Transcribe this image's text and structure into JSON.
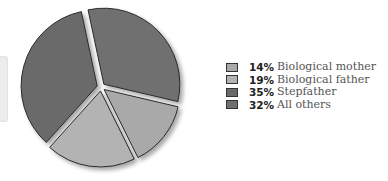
{
  "chart_data": {
    "type": "pie",
    "title": "",
    "exploded": true,
    "slices": [
      {
        "label": "Biological mother",
        "value": 14,
        "pct_label": "14%",
        "color": "#a9a9a9"
      },
      {
        "label": "Biological father",
        "value": 19,
        "pct_label": "19%",
        "color": "#b3b3b3"
      },
      {
        "label": "Stepfather",
        "value": 35,
        "pct_label": "35%",
        "color": "#6a6a6a"
      },
      {
        "label": "All others",
        "value": 32,
        "pct_label": "32%",
        "color": "#707070"
      }
    ],
    "legend_position": "right"
  },
  "legend": {
    "items": [
      {
        "pct": "14%",
        "label": "Biological mother",
        "color": "#a9a9a9"
      },
      {
        "pct": "19%",
        "label": "Biological father",
        "color": "#b3b3b3"
      },
      {
        "pct": "35%",
        "label": "Stepfather",
        "color": "#6a6a6a"
      },
      {
        "pct": "32%",
        "label": "All others",
        "color": "#707070"
      }
    ]
  }
}
